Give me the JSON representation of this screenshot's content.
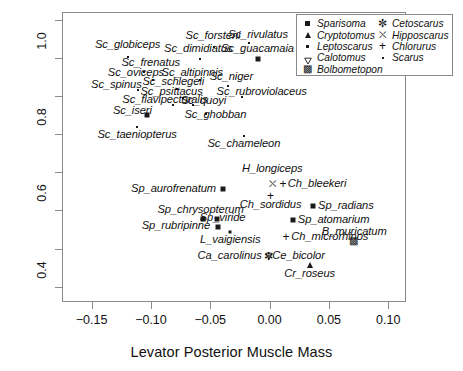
{
  "chart_data": {
    "type": "scatter",
    "title": "",
    "xlabel": "Levator Posterior Muscle Mass",
    "ylabel": "Jaw Closing Mechanical Advantage",
    "xlim": [
      -0.175,
      0.115
    ],
    "ylim": [
      0.36,
      1.12
    ],
    "xticks": [
      "-0.15",
      "-0.10",
      "-0.05",
      "0.00",
      "0.05",
      "0.10"
    ],
    "xtick_values": [
      -0.15,
      -0.1,
      -0.05,
      0.0,
      0.05,
      0.1
    ],
    "yticks": [
      "0.4",
      "0.6",
      "0.8",
      "1.0"
    ],
    "ytick_values": [
      0.4,
      0.6,
      0.8,
      1.0
    ],
    "grid": false,
    "legend_position": "top-right",
    "legend": [
      {
        "label": "Sparisoma",
        "marker": "filled-square"
      },
      {
        "label": "Cryptotomus",
        "marker": "filled-triangle-up"
      },
      {
        "label": "Leptoscarus",
        "marker": "small-filled-square"
      },
      {
        "label": "Calotomus",
        "marker": "open-triangle-down"
      },
      {
        "label": "Bolbometopon",
        "marker": "crossed-square"
      },
      {
        "label": "Cetoscarus",
        "marker": "asterisk-star"
      },
      {
        "label": "Hipposcarus",
        "marker": "boxed-cross"
      },
      {
        "label": "Chlorurus",
        "marker": "plus"
      },
      {
        "label": "Scarus",
        "marker": "tiny-dot"
      }
    ],
    "points": [
      {
        "label": "Sc_globiceps",
        "x": -0.1205,
        "y": 1.005,
        "marker": "tiny-dot",
        "lx": -0.1205,
        "ly": 1.035,
        "align": "c"
      },
      {
        "label": "Sc_forsteni",
        "x": -0.048,
        "y": 1.03,
        "marker": "tiny-dot",
        "lx": -0.0485,
        "ly": 1.06,
        "align": "c"
      },
      {
        "label": "Sc_rivulatus",
        "x": -0.0185,
        "y": 1.042,
        "marker": "tiny-dot",
        "lx": -0.0105,
        "ly": 1.062,
        "align": "c"
      },
      {
        "label": "Sc_dimidiatus",
        "x": -0.0595,
        "y": 1.0,
        "marker": "tiny-dot",
        "lx": -0.061,
        "ly": 1.026,
        "align": "c"
      },
      {
        "label": "Sc_guacamaia",
        "x": -0.011,
        "y": 1.0,
        "marker": "filled-square",
        "lx": -0.011,
        "ly": 1.026,
        "align": "c"
      },
      {
        "label": "Sc_frenatus",
        "x": -0.107,
        "y": 0.966,
        "marker": "tiny-dot",
        "lx": -0.101,
        "ly": 0.988,
        "align": "c"
      },
      {
        "label": "Sc_oviceps",
        "x": -0.099,
        "y": 0.944,
        "marker": "tiny-dot",
        "lx": -0.1135,
        "ly": 0.962,
        "align": "c"
      },
      {
        "label": "Sc_altipinnis",
        "x": -0.0595,
        "y": 0.944,
        "marker": "tiny-dot",
        "lx": -0.066,
        "ly": 0.962,
        "align": "c"
      },
      {
        "label": "Sc_niger",
        "x": -0.0355,
        "y": 0.929,
        "marker": "tiny-dot",
        "lx": -0.033,
        "ly": 0.952,
        "align": "c"
      },
      {
        "label": "Sc_spinus",
        "x": -0.1115,
        "y": 0.918,
        "marker": "tiny-dot",
        "lx": -0.13,
        "ly": 0.932,
        "align": "c"
      },
      {
        "label": "Sc_schlegeli",
        "x": -0.079,
        "y": 0.92,
        "marker": "tiny-dot",
        "lx": -0.082,
        "ly": 0.938,
        "align": "c"
      },
      {
        "label": "Sc_rubroviolaceus",
        "x": -0.0245,
        "y": 0.901,
        "marker": "tiny-dot",
        "lx": -0.0075,
        "ly": 0.912,
        "align": "c"
      },
      {
        "label": "Sc_psittacus",
        "x": -0.074,
        "y": 0.898,
        "marker": "tiny-dot",
        "lx": -0.0835,
        "ly": 0.914,
        "align": "c"
      },
      {
        "label": "Sc_quoyi",
        "x": -0.065,
        "y": 0.88,
        "marker": "tiny-dot",
        "lx": -0.0565,
        "ly": 0.89,
        "align": "c"
      },
      {
        "label": "Sc_flavipectoralis",
        "x": -0.0825,
        "y": 0.878,
        "marker": "tiny-dot",
        "lx": -0.089,
        "ly": 0.892,
        "align": "c"
      },
      {
        "label": "Sc_iseri",
        "x": -0.1045,
        "y": 0.852,
        "marker": "filled-square",
        "lx": -0.1165,
        "ly": 0.862,
        "align": "c"
      },
      {
        "label": "Sc_ghobban",
        "x": -0.0545,
        "y": 0.856,
        "marker": "tiny-dot",
        "lx": -0.0465,
        "ly": 0.852,
        "align": "c"
      },
      {
        "label": "Sc_taeniopterus",
        "x": -0.1125,
        "y": 0.822,
        "marker": "tiny-dot",
        "lx": -0.1125,
        "ly": 0.8,
        "align": "c"
      },
      {
        "label": "Sc_chameleon",
        "x": -0.0225,
        "y": 0.798,
        "marker": "tiny-dot",
        "lx": -0.0225,
        "ly": 0.776,
        "align": "c"
      },
      {
        "label": "H_longiceps",
        "x": 0.0015,
        "y": 0.672,
        "marker": "boxed-cross",
        "lx": 0.0015,
        "ly": 0.712,
        "align": "c"
      },
      {
        "label": "Ch_bleekeri",
        "x": 0.0105,
        "y": 0.672,
        "marker": "plus",
        "lx": 0.0145,
        "ly": 0.672,
        "align": "l"
      },
      {
        "label": "Sp_aurofrenatum",
        "x": -0.0405,
        "y": 0.66,
        "marker": "filled-square",
        "lx": -0.046,
        "ly": 0.66,
        "align": "r"
      },
      {
        "label": "Ch_sordidus",
        "x": 0.0,
        "y": 0.641,
        "marker": "plus",
        "lx": 0.0,
        "ly": 0.618,
        "align": "c"
      },
      {
        "label": "Sp_radians",
        "x": 0.036,
        "y": 0.615,
        "marker": "filled-square",
        "lx": 0.04,
        "ly": 0.615,
        "align": "l"
      },
      {
        "label": "Sp_chrysopterum",
        "x": -0.057,
        "y": 0.58,
        "marker": "filled-square",
        "lx": -0.059,
        "ly": 0.603,
        "align": "c"
      },
      {
        "label": "Sp_viride",
        "x": -0.045,
        "y": 0.58,
        "marker": "filled-square",
        "lx": -0.0405,
        "ly": 0.583,
        "align": "c"
      },
      {
        "label": "Sp_atomarium",
        "x": 0.019,
        "y": 0.577,
        "marker": "filled-square",
        "lx": 0.023,
        "ly": 0.577,
        "align": "l"
      },
      {
        "label": "Sp_rubripinne",
        "x": -0.044,
        "y": 0.559,
        "marker": "filled-square",
        "lx": -0.051,
        "ly": 0.561,
        "align": "r"
      },
      {
        "label": "L_vaigiensis",
        "x": -0.034,
        "y": 0.545,
        "marker": "small-filled-square",
        "lx": -0.034,
        "ly": 0.524,
        "align": "c"
      },
      {
        "label": "Ch_microrhinos",
        "x": 0.013,
        "y": 0.533,
        "marker": "plus",
        "lx": 0.0175,
        "ly": 0.533,
        "align": "l"
      },
      {
        "label": "B_muricatum",
        "x": 0.0695,
        "y": 0.522,
        "marker": "crossed-square",
        "lx": 0.0705,
        "ly": 0.546,
        "align": "c"
      },
      {
        "label": "Ca_carolinus",
        "x": -0.0035,
        "y": 0.484,
        "marker": "open-triangle-down",
        "lx": -0.0075,
        "ly": 0.484,
        "align": "r"
      },
      {
        "label": "Ce_bicolor",
        "x": -0.002,
        "y": 0.484,
        "marker": "asterisk-star",
        "lx": 0.0015,
        "ly": 0.484,
        "align": "l"
      },
      {
        "label": "Cr_roseus",
        "x": 0.033,
        "y": 0.46,
        "marker": "filled-triangle-up",
        "lx": 0.033,
        "ly": 0.437,
        "align": "c"
      }
    ]
  }
}
